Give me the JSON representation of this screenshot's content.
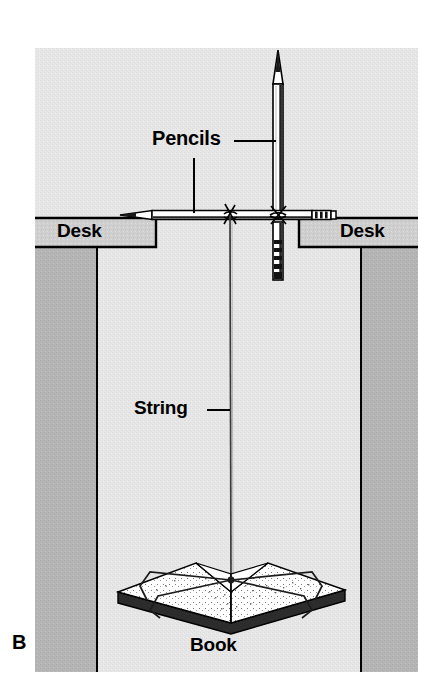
{
  "figure": {
    "panel_letter": "B",
    "canvas": {
      "width": 445,
      "height": 700,
      "background": "#ffffff"
    },
    "frame": {
      "left": 35,
      "top": 48,
      "right": 418,
      "bottom": 672
    }
  },
  "labels": {
    "pencils": "Pencils",
    "desk_left": "Desk",
    "desk_right": "Desk",
    "string": "String",
    "book": "Book",
    "panel": "B"
  },
  "colors": {
    "ink": "#000000",
    "wall_light": "#e6e6e6",
    "desk_face": "#b5b5b5",
    "desk_top": "#cfcfcf",
    "paper_white": "#ffffff",
    "page_shade": "#d8d8d8",
    "background": "#ffffff"
  },
  "parts": [
    {
      "name": "wall-background",
      "kind": "surface",
      "description": "light gray textured backdrop panel",
      "color": "#e6e6e6"
    },
    {
      "name": "desk-left",
      "kind": "furniture",
      "description": "left desk with top surface band and darker side panel",
      "top_band": {
        "x": 35,
        "y": 218,
        "width": 120,
        "height": 30
      },
      "side_panel": {
        "x": 35,
        "y": 248,
        "width": 62,
        "height": 424
      }
    },
    {
      "name": "desk-right",
      "kind": "furniture",
      "description": "right desk with top surface band and darker side panel",
      "top_band": {
        "x": 300,
        "y": 218,
        "width": 118,
        "height": 30
      },
      "side_panel": {
        "x": 361,
        "y": 248,
        "width": 57,
        "height": 424
      }
    },
    {
      "name": "pencil-horizontal",
      "kind": "pencil",
      "description": "pencil lying across the gap between the two desks, sharpened tip at left, metal ferrule and eraser at right",
      "from_x": 120,
      "to_x": 336,
      "y": 215
    },
    {
      "name": "pencil-vertical",
      "kind": "pencil",
      "description": "pencil standing upright, sharpened tip at top, crossing the horizontal pencil and hanging below the desk line",
      "x": 278,
      "top_y": 50,
      "bottom_y": 280
    },
    {
      "name": "string-tie-left",
      "kind": "knot",
      "description": "string knot lashing the vertical string to the horizontal pencil",
      "x": 230,
      "y": 215
    },
    {
      "name": "string-tie-cross",
      "kind": "knot",
      "description": "string knot binding the vertical pencil to the horizontal pencil",
      "x": 278,
      "y": 215
    },
    {
      "name": "string-vertical",
      "kind": "string",
      "description": "long string from the pencil crossing down to the book",
      "top_x": 230,
      "top_y": 215,
      "bottom_x": 231,
      "bottom_y": 578
    },
    {
      "name": "book",
      "kind": "book",
      "description": "open hardcover book seen in perspective, bound with string loops around both covers",
      "center_x": 231,
      "center_y": 600
    }
  ],
  "leader_lines": [
    {
      "name": "pencils-leader-horizontal",
      "from": [
        234,
        141
      ],
      "to": [
        276,
        141
      ],
      "target": "pencil-vertical"
    },
    {
      "name": "pencils-leader-vertical",
      "from": [
        194,
        158
      ],
      "to": [
        194,
        214
      ],
      "target": "pencil-horizontal"
    },
    {
      "name": "string-leader",
      "from": [
        207,
        410
      ],
      "to": [
        230,
        410
      ],
      "target": "string-vertical"
    }
  ]
}
